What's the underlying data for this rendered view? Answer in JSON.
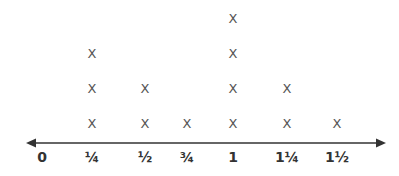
{
  "chart_data": {
    "type": "scatter",
    "subtype": "line-plot",
    "title": "",
    "xlabel": "",
    "ylabel": "",
    "marker": "X",
    "categories": [
      "0",
      "¼",
      "½",
      "¾",
      "1",
      "1¼",
      "1½"
    ],
    "x": [
      0,
      0.25,
      0.5,
      0.75,
      1,
      1.25,
      1.5
    ],
    "values": [
      0,
      3,
      2,
      1,
      4,
      2,
      1
    ],
    "colors": {
      "axis": "#333333",
      "marks": "#555555"
    }
  }
}
